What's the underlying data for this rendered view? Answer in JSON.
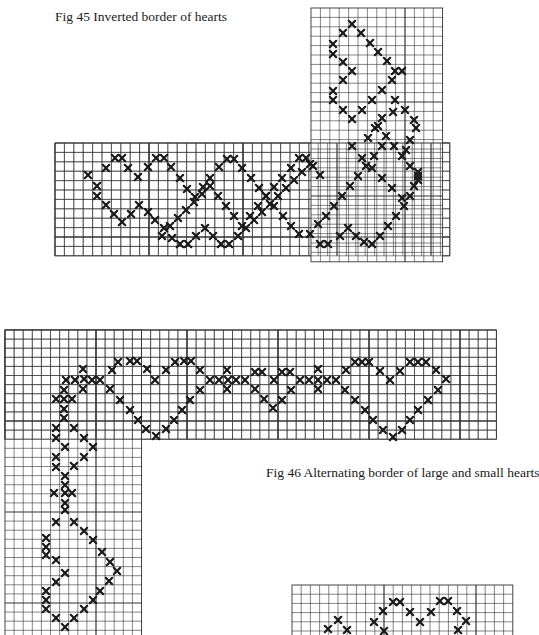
{
  "figures": [
    {
      "id": "fig45",
      "caption": "Fig 45 Inverted border of hearts",
      "cell": 9.4,
      "grids": [
        {
          "x": 55,
          "y": 143,
          "cols": 42,
          "rows": 12
        },
        {
          "x": 311,
          "y": 8,
          "cols": 14,
          "rows": 27
        }
      ],
      "marks": [
        [
          88,
          175
        ],
        [
          97,
          186
        ],
        [
          106,
          168
        ],
        [
          115,
          158
        ],
        [
          122,
          158
        ],
        [
          128,
          168
        ],
        [
          138,
          177
        ],
        [
          148,
          167
        ],
        [
          156,
          158
        ],
        [
          164,
          158
        ],
        [
          171,
          167
        ],
        [
          180,
          178
        ],
        [
          187,
          189
        ],
        [
          195,
          197
        ],
        [
          203,
          187
        ],
        [
          210,
          178
        ],
        [
          219,
          167
        ],
        [
          227,
          159
        ],
        [
          234,
          159
        ],
        [
          242,
          168
        ],
        [
          251,
          178
        ],
        [
          259,
          188
        ],
        [
          266,
          196
        ],
        [
          274,
          187
        ],
        [
          282,
          178
        ],
        [
          291,
          168
        ],
        [
          299,
          158
        ],
        [
          306,
          158
        ],
        [
          313,
          166
        ],
        [
          320,
          175
        ],
        [
          97,
          196
        ],
        [
          106,
          205
        ],
        [
          114,
          214
        ],
        [
          122,
          222
        ],
        [
          131,
          214
        ],
        [
          139,
          205
        ],
        [
          148,
          212
        ],
        [
          155,
          220
        ],
        [
          164,
          228
        ],
        [
          172,
          238
        ],
        [
          180,
          244
        ],
        [
          188,
          244
        ],
        [
          196,
          236
        ],
        [
          205,
          228
        ],
        [
          213,
          236
        ],
        [
          221,
          244
        ],
        [
          229,
          244
        ],
        [
          238,
          236
        ],
        [
          246,
          228
        ],
        [
          254,
          220
        ],
        [
          262,
          212
        ],
        [
          270,
          204
        ],
        [
          278,
          196
        ],
        [
          286,
          188
        ],
        [
          294,
          180
        ],
        [
          302,
          172
        ],
        [
          310,
          164
        ],
        [
          162,
          236
        ],
        [
          170,
          226
        ],
        [
          178,
          218
        ],
        [
          186,
          210
        ],
        [
          194,
          202
        ],
        [
          202,
          194
        ],
        [
          210,
          186
        ],
        [
          218,
          196
        ],
        [
          226,
          206
        ],
        [
          234,
          216
        ],
        [
          242,
          226
        ],
        [
          250,
          216
        ],
        [
          258,
          206
        ],
        [
          266,
          196
        ],
        [
          274,
          206
        ],
        [
          283,
          216
        ],
        [
          291,
          226
        ],
        [
          299,
          234
        ],
        [
          310,
          234
        ],
        [
          318,
          224
        ],
        [
          326,
          216
        ],
        [
          334,
          206
        ],
        [
          342,
          196
        ],
        [
          350,
          186
        ],
        [
          358,
          176
        ],
        [
          366,
          166
        ],
        [
          374,
          156
        ],
        [
          382,
          146
        ],
        [
          320,
          244
        ],
        [
          328,
          244
        ],
        [
          340,
          236
        ],
        [
          348,
          228
        ],
        [
          356,
          236
        ],
        [
          364,
          242
        ],
        [
          372,
          244
        ],
        [
          380,
          236
        ],
        [
          388,
          226
        ],
        [
          396,
          216
        ],
        [
          404,
          206
        ],
        [
          410,
          196
        ],
        [
          414,
          186
        ],
        [
          418,
          176
        ],
        [
          410,
          166
        ],
        [
          402,
          156
        ],
        [
          394,
          146
        ],
        [
          386,
          136
        ],
        [
          378,
          126
        ],
        [
          352,
          24
        ],
        [
          343,
          33
        ],
        [
          361,
          33
        ],
        [
          370,
          43
        ],
        [
          378,
          52
        ],
        [
          387,
          61
        ],
        [
          395,
          71
        ],
        [
          333,
          44
        ],
        [
          333,
          54
        ],
        [
          343,
          62
        ],
        [
          352,
          71
        ],
        [
          343,
          80
        ],
        [
          333,
          91
        ],
        [
          333,
          100
        ],
        [
          343,
          110
        ],
        [
          352,
          119
        ],
        [
          362,
          110
        ],
        [
          372,
          100
        ],
        [
          382,
          90
        ],
        [
          392,
          80
        ],
        [
          402,
          71
        ],
        [
          395,
          100
        ],
        [
          405,
          110
        ],
        [
          414,
          120
        ],
        [
          416,
          128
        ],
        [
          410,
          140
        ],
        [
          406,
          150
        ],
        [
          418,
          172
        ],
        [
          418,
          180
        ],
        [
          375,
          128
        ],
        [
          368,
          138
        ],
        [
          382,
          118
        ],
        [
          393,
          112
        ],
        [
          352,
          146
        ],
        [
          362,
          158
        ],
        [
          372,
          168
        ],
        [
          382,
          178
        ],
        [
          392,
          188
        ],
        [
          402,
          198
        ]
      ]
    },
    {
      "id": "fig46",
      "caption": "Fig 46 Alternating border of large and small hearts",
      "cell": 9.1,
      "grids": [
        {
          "x": 5,
          "y": 330,
          "cols": 54,
          "rows": 12
        },
        {
          "x": 5,
          "y": 330,
          "cols": 15,
          "rows": 34
        }
      ],
      "marks": [
        [
          66,
          380
        ],
        [
          75,
          380
        ],
        [
          84,
          379
        ],
        [
          92,
          380
        ],
        [
          100,
          380
        ],
        [
          83,
          369
        ],
        [
          83,
          389
        ],
        [
          112,
          370
        ],
        [
          118,
          362
        ],
        [
          130,
          361
        ],
        [
          137,
          361
        ],
        [
          147,
          369
        ],
        [
          155,
          380
        ],
        [
          166,
          370
        ],
        [
          175,
          362
        ],
        [
          184,
          361
        ],
        [
          191,
          361
        ],
        [
          200,
          370
        ],
        [
          210,
          380
        ],
        [
          219,
          380
        ],
        [
          228,
          380
        ],
        [
          236,
          380
        ],
        [
          245,
          380
        ],
        [
          255,
          372
        ],
        [
          262,
          372
        ],
        [
          274,
          380
        ],
        [
          282,
          372
        ],
        [
          290,
          372
        ],
        [
          300,
          380
        ],
        [
          309,
          380
        ],
        [
          318,
          380
        ],
        [
          327,
          380
        ],
        [
          336,
          380
        ],
        [
          346,
          370
        ],
        [
          355,
          362
        ],
        [
          362,
          362
        ],
        [
          369,
          362
        ],
        [
          380,
          371
        ],
        [
          390,
          380
        ],
        [
          400,
          371
        ],
        [
          410,
          362
        ],
        [
          418,
          362
        ],
        [
          426,
          362
        ],
        [
          436,
          370
        ],
        [
          446,
          379
        ],
        [
          110,
          389
        ],
        [
          120,
          400
        ],
        [
          130,
          410
        ],
        [
          138,
          420
        ],
        [
          146,
          429
        ],
        [
          156,
          436
        ],
        [
          166,
          429
        ],
        [
          174,
          420
        ],
        [
          182,
          410
        ],
        [
          190,
          400
        ],
        [
          200,
          390
        ],
        [
          227,
          370
        ],
        [
          227,
          389
        ],
        [
          255,
          389
        ],
        [
          264,
          399
        ],
        [
          273,
          408
        ],
        [
          282,
          400
        ],
        [
          291,
          390
        ],
        [
          318,
          369
        ],
        [
          318,
          389
        ],
        [
          345,
          390
        ],
        [
          355,
          400
        ],
        [
          365,
          410
        ],
        [
          373,
          420
        ],
        [
          383,
          430
        ],
        [
          393,
          437
        ],
        [
          402,
          430
        ],
        [
          410,
          420
        ],
        [
          418,
          410
        ],
        [
          428,
          400
        ],
        [
          438,
          390
        ],
        [
          56,
          399
        ],
        [
          64,
          399
        ],
        [
          72,
          399
        ],
        [
          64,
          390
        ],
        [
          64,
          409
        ],
        [
          64,
          418
        ],
        [
          56,
          428
        ],
        [
          74,
          428
        ],
        [
          56,
          438
        ],
        [
          84,
          438
        ],
        [
          65,
          447
        ],
        [
          93,
          447
        ],
        [
          56,
          457
        ],
        [
          84,
          457
        ],
        [
          56,
          467
        ],
        [
          74,
          466
        ],
        [
          65,
          476
        ],
        [
          54,
          493
        ],
        [
          65,
          493
        ],
        [
          72,
          493
        ],
        [
          65,
          485
        ],
        [
          65,
          503
        ],
        [
          65,
          510
        ],
        [
          56,
          522
        ],
        [
          74,
          522
        ],
        [
          84,
          531
        ],
        [
          46,
          538
        ],
        [
          46,
          547
        ],
        [
          46,
          555
        ],
        [
          93,
          540
        ],
        [
          102,
          552
        ],
        [
          110,
          562
        ],
        [
          117,
          571
        ],
        [
          56,
          560
        ],
        [
          65,
          573
        ],
        [
          56,
          582
        ],
        [
          109,
          581
        ],
        [
          100,
          591
        ],
        [
          46,
          591
        ],
        [
          46,
          600
        ],
        [
          46,
          609
        ],
        [
          93,
          600
        ],
        [
          84,
          609
        ],
        [
          74,
          618
        ],
        [
          56,
          618
        ],
        [
          65,
          627
        ]
      ]
    },
    {
      "id": "fig47-partial",
      "caption": "",
      "cell": 9.2,
      "grids": [
        {
          "x": 292,
          "y": 585,
          "cols": 24,
          "rows": 6
        }
      ],
      "marks": [
        [
          328,
          629
        ],
        [
          338,
          620
        ],
        [
          347,
          630
        ],
        [
          374,
          622
        ],
        [
          383,
          611
        ],
        [
          393,
          602
        ],
        [
          400,
          602
        ],
        [
          410,
          612
        ],
        [
          420,
          622
        ],
        [
          431,
          612
        ],
        [
          440,
          601
        ],
        [
          448,
          601
        ],
        [
          457,
          611
        ],
        [
          466,
          621
        ],
        [
          458,
          630
        ],
        [
          384,
          631
        ]
      ]
    }
  ],
  "captions": {
    "fig45": "Fig 45 Inverted border of hearts",
    "fig46": "Fig 46 Alternating border of large and small hearts"
  },
  "colors": {
    "ink": "#1a1a1a",
    "grid": "#333333",
    "paper": "#ffffff"
  }
}
